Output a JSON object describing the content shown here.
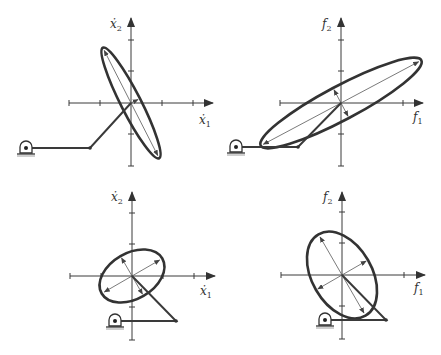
{
  "figure": {
    "type": "manipulability-ellipse-diagram",
    "panels": [
      {
        "id": "top-left",
        "space": "velocity",
        "x_label": "ẋ",
        "x_label_sub": "1",
        "y_label": "ẋ",
        "y_label_sub": "2",
        "origin": [
          131,
          103
        ],
        "ellipse": {
          "rx": 62,
          "ry": 10,
          "angle_deg": 63
        },
        "linkage": {
          "base": [
            26,
            148
          ],
          "elbow": [
            90,
            148
          ],
          "end": [
            131,
            103
          ]
        }
      },
      {
        "id": "top-right",
        "space": "force",
        "x_label": "f",
        "x_label_sub": "1",
        "y_label": "f",
        "y_label_sub": "2",
        "origin": [
          341,
          103
        ],
        "ellipse": {
          "rx": 91,
          "ry": 17,
          "angle_deg": -28
        },
        "linkage": {
          "base": [
            236,
            147
          ],
          "elbow": [
            298,
            147
          ],
          "end": [
            341,
            103
          ]
        }
      },
      {
        "id": "bottom-left",
        "space": "velocity",
        "x_label": "ẋ",
        "x_label_sub": "1",
        "y_label": "ẋ",
        "y_label_sub": "2",
        "origin": [
          132,
          276
        ],
        "ellipse": {
          "rx": 35,
          "ry": 23,
          "angle_deg": -30
        },
        "linkage": {
          "base": [
            115,
            321
          ],
          "elbow": [
            176,
            321
          ],
          "end": [
            132,
            276
          ]
        }
      },
      {
        "id": "bottom-right",
        "space": "force",
        "x_label": "f",
        "x_label_sub": "1",
        "y_label": "f",
        "y_label_sub": "2",
        "origin": [
          342,
          275
        ],
        "ellipse": {
          "rx": 47,
          "ry": 30,
          "angle_deg": 60
        },
        "linkage": {
          "base": [
            325,
            320
          ],
          "elbow": [
            386,
            320
          ],
          "end": [
            342,
            275
          ]
        }
      }
    ]
  },
  "labels": {
    "p1_y": "ẋ",
    "p1_y_sub": "2",
    "p1_x": "ẋ",
    "p1_x_sub": "1",
    "p2_y": "f",
    "p2_y_sub": "2",
    "p2_x": "f",
    "p2_x_sub": "1",
    "p3_y": "ẋ",
    "p3_y_sub": "2",
    "p3_x": "ẋ",
    "p3_x_sub": "1",
    "p4_y": "f",
    "p4_y_sub": "2",
    "p4_x": "f",
    "p4_x_sub": "1"
  },
  "colors": {
    "ink": "#333333",
    "background": "#ffffff"
  }
}
